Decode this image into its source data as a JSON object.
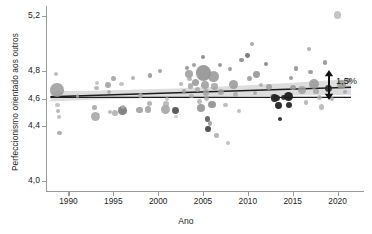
{
  "chart_data": {
    "type": "scatter",
    "title": "",
    "xlabel": "Ano",
    "ylabel": "Perfeccionismo orientado aos outros",
    "xlim": [
      1987.5,
      2022.5
    ],
    "ylim": [
      3.93,
      5.27
    ],
    "xticks": [
      1990,
      1995,
      2000,
      2005,
      2010,
      2015,
      2020
    ],
    "xtick_labels": [
      "1990",
      "1995",
      "2000",
      "2005",
      "2010",
      "2015",
      "2020"
    ],
    "yticks": [
      5.2,
      4.8,
      4.6,
      4.4,
      4.0
    ],
    "ytick_labels": [
      "5,2",
      "4,8",
      "4,6",
      "4,4",
      "4,0"
    ],
    "grid": false,
    "legend": null,
    "annotations": [
      {
        "text": "1,5%",
        "kind": "bracket-arrow",
        "x": 2021.5,
        "y": 4.665
      }
    ],
    "series": [
      {
        "name": "Regressão linear",
        "type": "line",
        "color": "#1c1c1c",
        "x": [
          1988.0,
          2021.5
        ],
        "y": [
          4.612,
          4.682
        ]
      },
      {
        "name": "Referência horizontal",
        "type": "line",
        "color": "#1c1c1c",
        "x": [
          1988.0,
          2021.5
        ],
        "y": [
          4.608,
          4.608
        ]
      },
      {
        "name": "Intervalo de confiança",
        "type": "band",
        "color": "#d7d7d7",
        "x": [
          1988.0,
          1995.0,
          2002.0,
          2009.0,
          2015.0,
          2021.5
        ],
        "y_lower": [
          4.578,
          4.596,
          4.608,
          4.616,
          4.622,
          4.628
        ],
        "y_upper": [
          4.652,
          4.66,
          4.672,
          4.692,
          4.714,
          4.742
        ]
      },
      {
        "name": "Amostras",
        "type": "scatter",
        "points": [
          {
            "x": 1988.6,
            "y": 4.775,
            "s": 2.0,
            "c": "#aeaeae",
            "a": 0.8
          },
          {
            "x": 1988.7,
            "y": 4.663,
            "s": 6.8,
            "c": "#9a9a9a",
            "a": 0.85
          },
          {
            "x": 1988.8,
            "y": 4.552,
            "s": 2.2,
            "c": "#b4b4b4",
            "a": 0.8
          },
          {
            "x": 1988.8,
            "y": 4.508,
            "s": 2.0,
            "c": "#a8a8a8",
            "a": 0.8
          },
          {
            "x": 1988.9,
            "y": 4.468,
            "s": 2.0,
            "c": "#b0b0b0",
            "a": 0.8
          },
          {
            "x": 1989.0,
            "y": 4.352,
            "s": 2.1,
            "c": "#a0a0a0",
            "a": 0.85
          },
          {
            "x": 1992.9,
            "y": 4.536,
            "s": 2.3,
            "c": "#9c9c9c",
            "a": 0.8
          },
          {
            "x": 1993.0,
            "y": 4.468,
            "s": 4.6,
            "c": "#a2a2a2",
            "a": 0.85
          },
          {
            "x": 1993.1,
            "y": 4.676,
            "s": 2.4,
            "c": "#a9a9a9",
            "a": 0.8
          },
          {
            "x": 1993.2,
            "y": 4.712,
            "s": 2.0,
            "c": "#b2b2b2",
            "a": 0.75
          },
          {
            "x": 1994.4,
            "y": 4.698,
            "s": 2.7,
            "c": "#9d9d9d",
            "a": 0.85
          },
          {
            "x": 1994.5,
            "y": 4.648,
            "s": 2.2,
            "c": "#a5a5a5",
            "a": 0.8
          },
          {
            "x": 1994.6,
            "y": 4.5,
            "s": 2.0,
            "c": "#aaaaaa",
            "a": 0.8
          },
          {
            "x": 1995.0,
            "y": 4.744,
            "s": 2.3,
            "c": "#999999",
            "a": 0.8
          },
          {
            "x": 1995.2,
            "y": 4.492,
            "s": 3.0,
            "c": "#a6a6a6",
            "a": 0.8
          },
          {
            "x": 1995.9,
            "y": 4.706,
            "s": 2.2,
            "c": "#b0b0b0",
            "a": 0.75
          },
          {
            "x": 1996.0,
            "y": 4.512,
            "s": 4.3,
            "c": "#6f6f6f",
            "a": 0.85
          },
          {
            "x": 1996.1,
            "y": 4.54,
            "s": 2.0,
            "c": "#adadad",
            "a": 0.8
          },
          {
            "x": 1997.2,
            "y": 4.748,
            "s": 2.4,
            "c": "#a3a3a3",
            "a": 0.8
          },
          {
            "x": 1997.9,
            "y": 4.516,
            "s": 3.4,
            "c": "#9a9a9a",
            "a": 0.85
          },
          {
            "x": 1998.0,
            "y": 4.624,
            "s": 2.5,
            "c": "#a8a8a8",
            "a": 0.8
          },
          {
            "x": 1998.9,
            "y": 4.52,
            "s": 3.1,
            "c": "#9e9e9e",
            "a": 0.85
          },
          {
            "x": 1999.0,
            "y": 4.562,
            "s": 2.5,
            "c": "#a4a4a4",
            "a": 0.8
          },
          {
            "x": 1999.1,
            "y": 4.764,
            "s": 2.4,
            "c": "#8f8f8f",
            "a": 0.85
          },
          {
            "x": 2000.2,
            "y": 4.8,
            "s": 2.1,
            "c": "#959595",
            "a": 0.85
          },
          {
            "x": 2000.8,
            "y": 4.52,
            "s": 4.7,
            "c": "#a0a0a0",
            "a": 0.85
          },
          {
            "x": 2000.9,
            "y": 4.56,
            "s": 3.1,
            "c": "#aaaaaa",
            "a": 0.8
          },
          {
            "x": 2001.0,
            "y": 4.596,
            "s": 2.2,
            "c": "#b2b2b2",
            "a": 0.75
          },
          {
            "x": 2001.9,
            "y": 4.512,
            "s": 3.4,
            "c": "#4b4b4b",
            "a": 0.9
          },
          {
            "x": 2002.5,
            "y": 4.708,
            "s": 2.0,
            "c": "#a6a6a6",
            "a": 0.8
          },
          {
            "x": 2002.9,
            "y": 4.652,
            "s": 2.3,
            "c": "#9d9d9d",
            "a": 0.8
          },
          {
            "x": 2003.2,
            "y": 4.82,
            "s": 2.2,
            "c": "#8b8b8b",
            "a": 0.85
          },
          {
            "x": 2003.4,
            "y": 4.776,
            "s": 4.0,
            "c": "#9a9a9a",
            "a": 0.85
          },
          {
            "x": 2003.5,
            "y": 4.74,
            "s": 2.1,
            "c": "#a4a4a4",
            "a": 0.8
          },
          {
            "x": 2003.6,
            "y": 4.69,
            "s": 2.8,
            "c": "#9f9f9f",
            "a": 0.8
          },
          {
            "x": 2003.7,
            "y": 4.62,
            "s": 2.2,
            "c": "#a9a9a9",
            "a": 0.8
          },
          {
            "x": 2004.0,
            "y": 4.84,
            "s": 2.0,
            "c": "#909090",
            "a": 0.85
          },
          {
            "x": 2004.2,
            "y": 4.716,
            "s": 3.6,
            "c": "#979797",
            "a": 0.85
          },
          {
            "x": 2004.4,
            "y": 4.664,
            "s": 2.3,
            "c": "#a5a5a5",
            "a": 0.8
          },
          {
            "x": 2004.6,
            "y": 4.58,
            "s": 2.5,
            "c": "#aaaaaa",
            "a": 0.8
          },
          {
            "x": 2004.8,
            "y": 4.532,
            "s": 3.9,
            "c": "#8e8e8e",
            "a": 0.85
          },
          {
            "x": 2005.0,
            "y": 4.9,
            "s": 2.4,
            "c": "#7f7f7f",
            "a": 0.85
          },
          {
            "x": 2005.1,
            "y": 4.784,
            "s": 7.6,
            "c": "#8c8c8c",
            "a": 0.85
          },
          {
            "x": 2005.2,
            "y": 4.7,
            "s": 4.1,
            "c": "#999999",
            "a": 0.85
          },
          {
            "x": 2005.3,
            "y": 4.644,
            "s": 3.1,
            "c": "#a1a1a1",
            "a": 0.8
          },
          {
            "x": 2005.4,
            "y": 4.6,
            "s": 2.4,
            "c": "#a8a8a8",
            "a": 0.8
          },
          {
            "x": 2005.5,
            "y": 4.452,
            "s": 2.6,
            "c": "#5d5d5d",
            "a": 0.9
          },
          {
            "x": 2005.6,
            "y": 4.38,
            "s": 2.9,
            "c": "#3f3f3f",
            "a": 0.9
          },
          {
            "x": 2005.8,
            "y": 4.42,
            "s": 2.2,
            "c": "#959595",
            "a": 0.85
          },
          {
            "x": 2006.0,
            "y": 4.556,
            "s": 3.6,
            "c": "#8a8a8a",
            "a": 0.85
          },
          {
            "x": 2006.2,
            "y": 4.76,
            "s": 5.6,
            "c": "#949494",
            "a": 0.85
          },
          {
            "x": 2006.3,
            "y": 4.688,
            "s": 3.2,
            "c": "#9e9e9e",
            "a": 0.8
          },
          {
            "x": 2006.5,
            "y": 4.332,
            "s": 2.2,
            "c": "#a5a5a5",
            "a": 0.8
          },
          {
            "x": 2006.9,
            "y": 4.844,
            "s": 2.2,
            "c": "#898989",
            "a": 0.85
          },
          {
            "x": 2007.0,
            "y": 4.648,
            "s": 2.7,
            "c": "#a0a0a0",
            "a": 0.8
          },
          {
            "x": 2007.5,
            "y": 4.552,
            "s": 2.1,
            "c": "#ababab",
            "a": 0.8
          },
          {
            "x": 2008.0,
            "y": 4.812,
            "s": 2.2,
            "c": "#8d8d8d",
            "a": 0.85
          },
          {
            "x": 2008.4,
            "y": 4.7,
            "s": 4.4,
            "c": "#979797",
            "a": 0.85
          },
          {
            "x": 2008.6,
            "y": 4.628,
            "s": 2.3,
            "c": "#a6a6a6",
            "a": 0.8
          },
          {
            "x": 2009.0,
            "y": 4.512,
            "s": 2.0,
            "c": "#afafaf",
            "a": 0.8
          },
          {
            "x": 2009.3,
            "y": 4.876,
            "s": 2.1,
            "c": "#828282",
            "a": 0.85
          },
          {
            "x": 2010.0,
            "y": 4.912,
            "s": 2.4,
            "c": "#6b6b6b",
            "a": 0.88
          },
          {
            "x": 2010.2,
            "y": 4.744,
            "s": 2.6,
            "c": "#949494",
            "a": 0.85
          },
          {
            "x": 2010.8,
            "y": 4.64,
            "s": 2.2,
            "c": "#a3a3a3",
            "a": 0.8
          },
          {
            "x": 2011.0,
            "y": 4.772,
            "s": 3.4,
            "c": "#8f8f8f",
            "a": 0.85
          },
          {
            "x": 2011.5,
            "y": 4.7,
            "s": 2.0,
            "c": "#a7a7a7",
            "a": 0.8
          },
          {
            "x": 2012.0,
            "y": 4.848,
            "s": 2.2,
            "c": "#7d7d7d",
            "a": 0.85
          },
          {
            "x": 2012.4,
            "y": 4.684,
            "s": 3.1,
            "c": "#9b9b9b",
            "a": 0.85
          },
          {
            "x": 2012.8,
            "y": 4.612,
            "s": 2.6,
            "c": "#a2a2a2",
            "a": 0.8
          },
          {
            "x": 2013.0,
            "y": 4.604,
            "s": 3.6,
            "c": "#1f1f1f",
            "a": 0.92
          },
          {
            "x": 2013.3,
            "y": 4.604,
            "s": 3.0,
            "c": "#232323",
            "a": 0.92
          },
          {
            "x": 2013.4,
            "y": 4.548,
            "s": 3.4,
            "c": "#1d1d1d",
            "a": 0.92
          },
          {
            "x": 2013.6,
            "y": 4.452,
            "s": 1.8,
            "c": "#2a2a2a",
            "a": 0.9
          },
          {
            "x": 2014.0,
            "y": 4.608,
            "s": 2.4,
            "c": "#262626",
            "a": 0.92
          },
          {
            "x": 2014.5,
            "y": 4.612,
            "s": 4.6,
            "c": "#1a1a1a",
            "a": 0.94
          },
          {
            "x": 2014.6,
            "y": 4.552,
            "s": 3.3,
            "c": "#1f1f1f",
            "a": 0.92
          },
          {
            "x": 2014.8,
            "y": 4.748,
            "s": 2.4,
            "c": "#8e8e8e",
            "a": 0.85
          },
          {
            "x": 2015.0,
            "y": 4.68,
            "s": 2.9,
            "c": "#999999",
            "a": 0.85
          },
          {
            "x": 2015.4,
            "y": 4.816,
            "s": 2.2,
            "c": "#8a8a8a",
            "a": 0.85
          },
          {
            "x": 2016.0,
            "y": 4.66,
            "s": 3.9,
            "c": "#9f9f9f",
            "a": 0.85
          },
          {
            "x": 2016.5,
            "y": 4.572,
            "s": 2.2,
            "c": "#a8a8a8",
            "a": 0.8
          },
          {
            "x": 2017.0,
            "y": 4.792,
            "s": 2.4,
            "c": "#8f8f8f",
            "a": 0.85
          },
          {
            "x": 2017.4,
            "y": 4.704,
            "s": 5.1,
            "c": "#989898",
            "a": 0.85
          },
          {
            "x": 2017.6,
            "y": 4.652,
            "s": 2.8,
            "c": "#a1a1a1",
            "a": 0.8
          },
          {
            "x": 2018.0,
            "y": 4.604,
            "s": 2.5,
            "c": "#aeaeae",
            "a": 0.8
          },
          {
            "x": 2018.2,
            "y": 4.54,
            "s": 2.8,
            "c": "#acacac",
            "a": 0.8
          },
          {
            "x": 2018.6,
            "y": 4.86,
            "s": 2.3,
            "c": "#8b8b8b",
            "a": 0.85
          },
          {
            "x": 2019.0,
            "y": 4.672,
            "s": 3.4,
            "c": "#2b2b2b",
            "a": 0.9
          },
          {
            "x": 2019.4,
            "y": 4.596,
            "s": 2.1,
            "c": "#a5a5a5",
            "a": 0.8
          },
          {
            "x": 2020.0,
            "y": 5.205,
            "s": 3.6,
            "c": "#b4b4b4",
            "a": 0.8
          },
          {
            "x": 2020.4,
            "y": 4.704,
            "s": 4.4,
            "c": "#9a9a9a",
            "a": 0.85
          },
          {
            "x": 2020.8,
            "y": 4.648,
            "s": 2.2,
            "c": "#a4a4a4",
            "a": 0.8
          },
          {
            "x": 2021.2,
            "y": 4.732,
            "s": 2.6,
            "c": "#969696",
            "a": 0.85
          },
          {
            "x": 1991.0,
            "y": 4.62,
            "s": 1.9,
            "c": "#b8b8b8",
            "a": 0.7
          },
          {
            "x": 2002.0,
            "y": 4.47,
            "s": 1.9,
            "c": "#b6b6b6",
            "a": 0.7
          },
          {
            "x": 2007.8,
            "y": 4.276,
            "s": 1.8,
            "c": "#b0b0b0",
            "a": 0.75
          },
          {
            "x": 2010.5,
            "y": 4.996,
            "s": 2.0,
            "c": "#9b9b9b",
            "a": 0.85
          },
          {
            "x": 2016.8,
            "y": 4.96,
            "s": 1.9,
            "c": "#a2a2a2",
            "a": 0.82
          }
        ]
      }
    ]
  },
  "annotation": {
    "label": "1,5%"
  }
}
